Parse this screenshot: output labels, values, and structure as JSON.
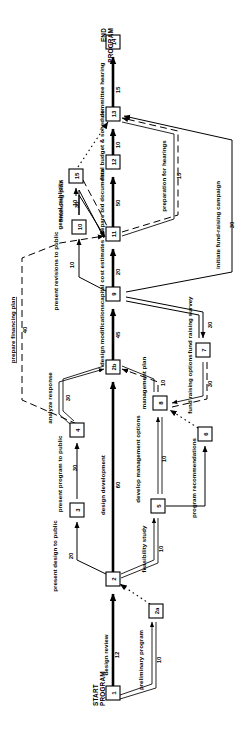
{
  "diagram": {
    "orientation": "rotated-90-ccw",
    "terminals": {
      "start_line1": "START",
      "start_line2": "PROGRAM",
      "end_line1": "END",
      "end_line2": "PROGRAM"
    },
    "nodes": [
      {
        "id": "n1",
        "label": "1",
        "x": 113,
        "y": 693
      },
      {
        "id": "n2",
        "label": "2",
        "x": 113,
        "y": 579
      },
      {
        "id": "n2a",
        "label": "2a",
        "x": 156,
        "y": 611
      },
      {
        "id": "n3",
        "label": "3",
        "x": 77,
        "y": 510
      },
      {
        "id": "n4",
        "label": "4",
        "x": 77,
        "y": 430
      },
      {
        "id": "n5",
        "label": "5",
        "x": 158,
        "y": 506
      },
      {
        "id": "n6",
        "label": "6",
        "x": 205,
        "y": 434
      },
      {
        "id": "n7",
        "label": "7",
        "x": 203,
        "y": 350
      },
      {
        "id": "n8",
        "label": "8",
        "x": 160,
        "y": 403
      },
      {
        "id": "n9",
        "label": "9",
        "x": 113,
        "y": 294
      },
      {
        "id": "n10",
        "label": "10",
        "x": 79,
        "y": 227
      },
      {
        "id": "n11",
        "label": "11",
        "x": 113,
        "y": 234
      },
      {
        "id": "n12",
        "label": "12",
        "x": 113,
        "y": 162
      },
      {
        "id": "n13",
        "label": "13",
        "x": 113,
        "y": 114
      },
      {
        "id": "n14",
        "label": "14",
        "x": 113,
        "y": 42
      },
      {
        "id": "n15",
        "label": "15",
        "x": 76,
        "y": 176
      },
      {
        "id": "nA",
        "label": "2b",
        "x": 113,
        "y": 367
      }
    ],
    "activities": [
      {
        "id": "a1",
        "name": "design review",
        "duration": "12",
        "critical": true
      },
      {
        "id": "a2",
        "name": "preliminary program",
        "duration": "10",
        "critical": false
      },
      {
        "id": "a3",
        "name": "present design to public",
        "duration": "20",
        "critical": false
      },
      {
        "id": "a4",
        "name": "feasibility study",
        "duration": "10",
        "critical": false
      },
      {
        "id": "a5",
        "name": "design development",
        "duration": "60",
        "critical": true
      },
      {
        "id": "a6",
        "name": "present program to public",
        "duration": "30",
        "critical": false
      },
      {
        "id": "a7",
        "name": "analyze response",
        "duration": "30",
        "critical": false
      },
      {
        "id": "a8",
        "name": "develop management options",
        "duration": "10",
        "critical": false
      },
      {
        "id": "a9",
        "name": "program recommendations",
        "duration": "",
        "critical": false
      },
      {
        "id": "a10",
        "name": "management plan",
        "duration": "10",
        "critical": false
      },
      {
        "id": "a11",
        "name": "fund raising options",
        "duration": "30",
        "critical": false
      },
      {
        "id": "a12",
        "name": "fund raising survey",
        "duration": "30",
        "critical": false
      },
      {
        "id": "a13",
        "name": "design modifications",
        "duration": "45",
        "critical": true
      },
      {
        "id": "a14",
        "name": "capital cost estimates",
        "duration": "20",
        "critical": true
      },
      {
        "id": "a15",
        "name": "present revisions to public",
        "duration": "10",
        "critical": false
      },
      {
        "id": "a16",
        "name": "general publicity",
        "duration": "30",
        "critical": false
      },
      {
        "id": "a17",
        "name": "prepare financing plan",
        "duration": "40",
        "critical": false
      },
      {
        "id": "a18",
        "name": "financing plan",
        "duration": "10",
        "critical": false
      },
      {
        "id": "a19",
        "name": "prepare bid documents",
        "duration": "50",
        "critical": true
      },
      {
        "id": "a20",
        "name": "final budget & schedule",
        "duration": "10",
        "critical": true
      },
      {
        "id": "a21",
        "name": "preparation for hearings",
        "duration": "15",
        "critical": false
      },
      {
        "id": "a22",
        "name": "initiate fund-raising campaign",
        "duration": "30",
        "critical": false
      },
      {
        "id": "a23",
        "name": "committee hearing",
        "duration": "15",
        "critical": true
      }
    ],
    "colors": {
      "background": "#ffffff",
      "line": "#000000",
      "node_fill": "#ffffff"
    }
  }
}
